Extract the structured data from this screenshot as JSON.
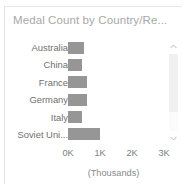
{
  "panel": {
    "title": "Medal Count by Country/Re..."
  },
  "scrollbar": {
    "up_icon": "chevron-up-icon",
    "down_icon": "chevron-down-icon"
  },
  "colors": {
    "bar": "#969696",
    "title_text": "#a8a8a8",
    "label_text": "#6f6f6f",
    "tick_text": "#7d7d7d",
    "panel_background": "#ffffff",
    "border": "#e3e3e3",
    "scroll_track": "#fbfbfb",
    "scroll_thumb": "#f0f0f0"
  },
  "chart_data": {
    "type": "bar",
    "orientation": "horizontal",
    "title": "Medal Count by Country/Re...",
    "xlabel": "(Thousands)",
    "ylabel": "",
    "grid": false,
    "legend": null,
    "xlim": [
      0,
      3000
    ],
    "xticks": [
      0,
      1000,
      2000,
      3000
    ],
    "xtick_labels": [
      "0K",
      "1K",
      "2K",
      "3K"
    ],
    "categories": [
      "Australia",
      "China",
      "France",
      "Germany",
      "Italy",
      "Soviet Uni...",
      "United Kin..."
    ],
    "values": [
      490,
      430,
      590,
      600,
      430,
      1000,
      900
    ],
    "units": "Thousands",
    "clipped_last_row": true,
    "scrollable": true
  }
}
